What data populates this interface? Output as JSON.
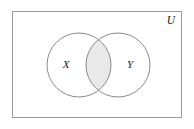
{
  "figure": {
    "type": "venn-diagram",
    "width": 194,
    "height": 129,
    "background_color": "#ffffff"
  },
  "universe": {
    "label": "U",
    "label_x": 171,
    "label_y": 21,
    "rect": {
      "x": 12,
      "y": 11,
      "width": 170,
      "height": 107
    },
    "border_color": "#9a9a9a",
    "fill_color": "#ffffff",
    "border_width": 1
  },
  "sets": [
    {
      "name": "set-x",
      "label": "X",
      "label_x": 66,
      "label_y": 65,
      "cx": 79,
      "cy": 65,
      "r": 32,
      "stroke_color": "#8a8a8a",
      "fill_color": "none"
    },
    {
      "name": "set-y",
      "label": "Y",
      "label_x": 130,
      "label_y": 65,
      "cx": 118,
      "cy": 65,
      "r": 32,
      "stroke_color": "#8a8a8a",
      "fill_color": "none"
    }
  ],
  "intersection": {
    "name": "x-intersect-y",
    "shaded": true,
    "fill_color": "#e9e9e9",
    "stroke_color": "#8a8a8a"
  },
  "style": {
    "stroke_width": 1,
    "label_color": "#1a1a1a"
  }
}
